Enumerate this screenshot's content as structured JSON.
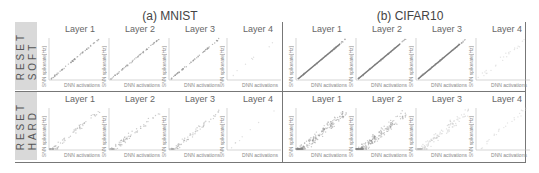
{
  "figure": {
    "columns": [
      {
        "title": "(a) MNIST"
      },
      {
        "title": "(b) CIFAR10"
      }
    ],
    "rows": [
      {
        "label_line1": "SOFT",
        "label_line2": "RESET"
      },
      {
        "label_line1": "HARD",
        "label_line2": "RESET"
      }
    ],
    "layer_titles": [
      "Layer 1",
      "Layer 2",
      "Layer 3",
      "Layer 4"
    ],
    "xlabel": "DNN activations",
    "ylabel": "SNN spikerate[Hz]"
  },
  "chart_data": {
    "type": "scatter",
    "xlabel": "DNN activations",
    "ylabel": "SNN spikerate[Hz]",
    "panels": [
      {
        "dataset": "MNIST",
        "reset": "SOFT",
        "layers": [
          "Layer 1",
          "Layer 2",
          "Layer 3",
          "Layer 4"
        ],
        "pattern": "tight diagonal correlation; Layer 4 sparse"
      },
      {
        "dataset": "CIFAR10",
        "reset": "SOFT",
        "layers": [
          "Layer 1",
          "Layer 2",
          "Layer 3",
          "Layer 4"
        ],
        "pattern": "tight diagonal correlation; Layer 4 faint"
      },
      {
        "dataset": "MNIST",
        "reset": "HARD",
        "layers": [
          "Layer 1",
          "Layer 2",
          "Layer 3",
          "Layer 4"
        ],
        "pattern": "diagonal with scatter below; Layer 4 sparse"
      },
      {
        "dataset": "CIFAR10",
        "reset": "HARD",
        "layers": [
          "Layer 1",
          "Layer 2",
          "Layer 3",
          "Layer 4"
        ],
        "pattern": "wide dispersed cloud near origin; Layer 4 faint"
      }
    ],
    "grid": false,
    "legend": "none"
  }
}
